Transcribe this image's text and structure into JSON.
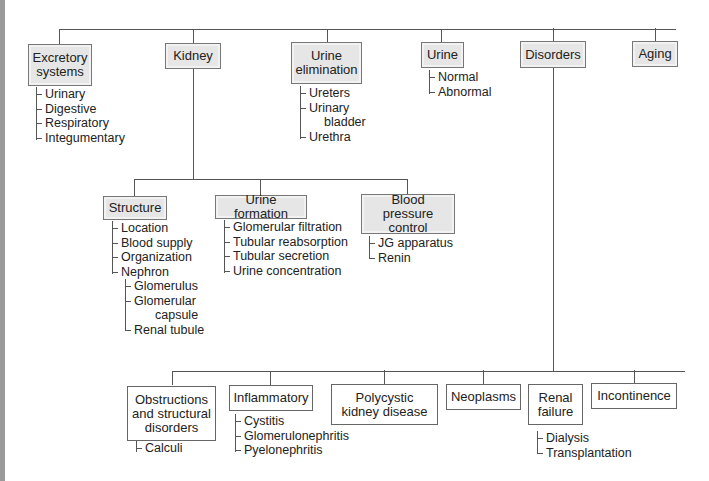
{
  "diagram": {
    "top_nodes": [
      {
        "label": "Excretory systems",
        "children": [
          "Urinary",
          "Digestive",
          "Respiratory",
          "Integumentary"
        ]
      },
      {
        "label": "Kidney"
      },
      {
        "label": "Urine elimination",
        "children": [
          "Ureters",
          "Urinary",
          "bladder",
          "Urethra"
        ]
      },
      {
        "label": "Urine",
        "children": [
          "Normal",
          "Abnormal"
        ]
      },
      {
        "label": "Disorders"
      },
      {
        "label": "Aging"
      }
    ],
    "kidney_nodes": [
      {
        "label": "Structure",
        "children": [
          "Location",
          "Blood supply",
          "Organization",
          "Nephron"
        ],
        "nephron_children": [
          "Glomerulus",
          "Glomerular",
          "capsule",
          "Renal tubule"
        ]
      },
      {
        "label": "Urine formation",
        "children": [
          "Glomerular filtration",
          "Tubular reabsorption",
          "Tubular secretion",
          "Urine concentration"
        ]
      },
      {
        "label": "Blood pressure control",
        "children": [
          "JG apparatus",
          "Renin"
        ]
      }
    ],
    "disorder_nodes": [
      {
        "label": "Obstructions and structural disorders",
        "children": [
          "Calculi"
        ]
      },
      {
        "label": "Inflammatory",
        "children": [
          "Cystitis",
          "Glomerulonephritis",
          "Pyelonephritis"
        ]
      },
      {
        "label": "Polycystic kidney disease"
      },
      {
        "label": "Neoplasms"
      },
      {
        "label": "Renal failure",
        "children": [
          "Dialysis",
          "Transplantation"
        ]
      },
      {
        "label": "Incontinence"
      }
    ]
  }
}
